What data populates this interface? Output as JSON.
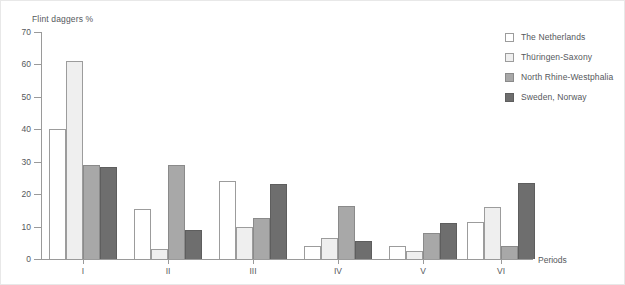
{
  "chart_data": {
    "type": "bar",
    "title": "",
    "ylabel": "Flint daggers %",
    "xlabel": "Periods",
    "categories": [
      "I",
      "II",
      "III",
      "IV",
      "V",
      "VI"
    ],
    "ylim": [
      0,
      70
    ],
    "yticks": [
      0,
      10,
      20,
      30,
      40,
      50,
      60,
      70
    ],
    "grid": false,
    "legend_position": "top-right",
    "series": [
      {
        "name": "The Netherlands",
        "color": "#ffffff",
        "values": [
          40,
          15.5,
          24,
          4,
          4,
          11.5
        ]
      },
      {
        "name": "Thüringen-Saxony",
        "color": "#efefef",
        "values": [
          61,
          3,
          10,
          6.5,
          2.5,
          16
        ]
      },
      {
        "name": "North Rhine-Westphalia",
        "color": "#a8a8a8",
        "values": [
          29,
          29,
          12.5,
          16.5,
          8,
          4
        ]
      },
      {
        "name": "Sweden, Norway",
        "color": "#6e6e6e",
        "values": [
          28.5,
          9,
          23,
          5.5,
          11,
          23.5
        ]
      }
    ]
  }
}
